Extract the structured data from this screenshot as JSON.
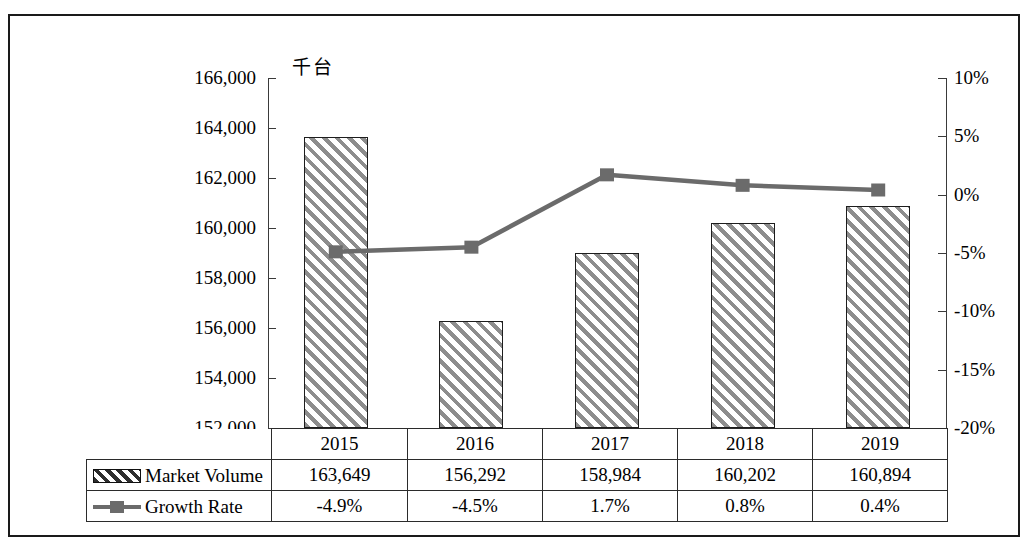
{
  "chart_data": {
    "type": "bar",
    "title": "",
    "subtitle": "",
    "unit_label": "千台",
    "categories": [
      "2015",
      "2016",
      "2017",
      "2018",
      "2019"
    ],
    "xlabel": "",
    "ylabel": "",
    "y_left": {
      "ticks": [
        "152,000",
        "154,000",
        "156,000",
        "158,000",
        "160,000",
        "162,000",
        "164,000",
        "166,000"
      ],
      "tick_values": [
        152000,
        154000,
        156000,
        158000,
        160000,
        162000,
        164000,
        166000
      ],
      "ylim": [
        152000,
        166000
      ],
      "unit": "千台"
    },
    "y_right": {
      "ticks": [
        "-20%",
        "-15%",
        "-10%",
        "-5%",
        "0%",
        "5%",
        "10%"
      ],
      "tick_values": [
        -20,
        -15,
        -10,
        -5,
        0,
        5,
        10
      ],
      "ylim": [
        -20,
        10
      ]
    },
    "grid": false,
    "legend_position": "bottom-table",
    "series": [
      {
        "name": "Market Volume",
        "type": "bar",
        "axis": "left",
        "values": [
          163649,
          156292,
          158984,
          160202,
          160894
        ],
        "labels": [
          "163,649",
          "156,292",
          "158,984",
          "160,202",
          "160,894"
        ],
        "marker": "hatched-rectangle",
        "color": "#8d8d8d"
      },
      {
        "name": "Growth Rate",
        "type": "line",
        "axis": "right",
        "values": [
          -4.9,
          -4.5,
          1.7,
          0.8,
          0.4
        ],
        "labels": [
          "-4.9%",
          "-4.5%",
          "1.7%",
          "0.8%",
          "0.4%"
        ],
        "marker": "square",
        "color": "#6b6b6b"
      }
    ]
  },
  "table": {
    "header_row": [
      "",
      "2015",
      "2016",
      "2017",
      "2018",
      "2019"
    ],
    "rows": [
      {
        "label": "Market Volume",
        "marker": "hatch-key-icon",
        "cells": [
          "163,649",
          "156,292",
          "158,984",
          "160,202",
          "160,894"
        ]
      },
      {
        "label": "Growth Rate",
        "marker": "line-key-icon",
        "cells": [
          "-4.9%",
          "-4.5%",
          "1.7%",
          "0.8%",
          "0.4%"
        ]
      }
    ]
  },
  "colors": {
    "bar_hatch": "#8d8d8d",
    "bar_border": "#1d1d1d",
    "line": "#6b6b6b",
    "axis": "#3a3a3a",
    "frame": "#1a1a1a",
    "table_border": "#2b2b2b",
    "background": "#ffffff"
  }
}
